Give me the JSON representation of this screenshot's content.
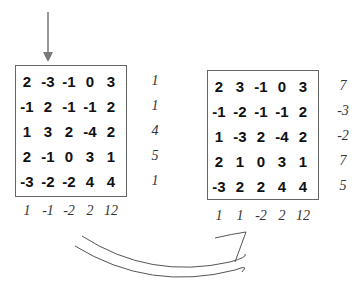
{
  "left": {
    "matrix": [
      [
        "2",
        "-3",
        "-1",
        "0",
        "3"
      ],
      [
        "-1",
        "2",
        "-1",
        "-1",
        "2"
      ],
      [
        "1",
        "3",
        "2",
        "-4",
        "2"
      ],
      [
        "2",
        "-1",
        "0",
        "3",
        "1"
      ],
      [
        "-3",
        "-2",
        "-2",
        "4",
        "4"
      ]
    ],
    "row_sums": [
      "1",
      "1",
      "4",
      "5",
      "1"
    ],
    "col_sums": [
      "1",
      "-1",
      "-2",
      "2",
      "12"
    ]
  },
  "right": {
    "matrix": [
      [
        "2",
        "3",
        "-1",
        "0",
        "3"
      ],
      [
        "-1",
        "-2",
        "-1",
        "-1",
        "2"
      ],
      [
        "1",
        "-3",
        "2",
        "-4",
        "2"
      ],
      [
        "2",
        "1",
        "0",
        "3",
        "1"
      ],
      [
        "-3",
        "2",
        "2",
        "4",
        "4"
      ]
    ],
    "row_sums": [
      "7",
      "-3",
      "-2",
      "7",
      "5"
    ],
    "col_sums": [
      "1",
      "1",
      "-2",
      "2",
      "12"
    ]
  },
  "icons": {
    "pointer_arrow": "down-arrow-icon",
    "transform_arrow": "curved-right-arrow-icon"
  }
}
